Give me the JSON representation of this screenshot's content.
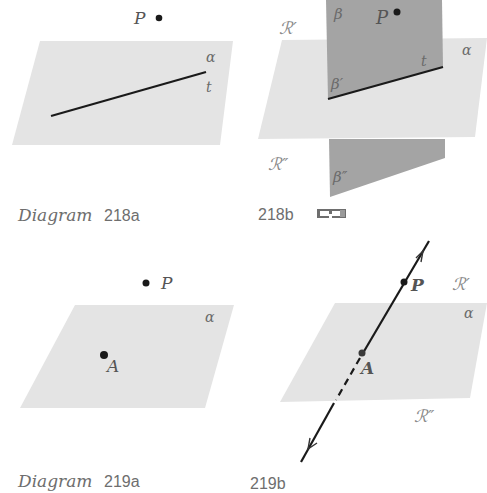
{
  "colors": {
    "plane_light": "#e4e4e4",
    "plane_dark": "#a4a4a4",
    "line": "#1a1a1a",
    "label": "#6a6a6a"
  },
  "diagram_218a": {
    "caption_word": "Diagram",
    "caption_number": "218a",
    "point_label": "P",
    "plane_label": "α",
    "line_label": "t"
  },
  "diagram_218b": {
    "caption_number": "218b",
    "icon": "3d-glasses-icon",
    "region_upper": "ℛ′",
    "region_lower": "ℛ″",
    "plane_label": "α",
    "half_plane_label": "β",
    "half_plane_upper_label": "β′",
    "half_plane_lower_label": "β″",
    "point_label": "P",
    "line_label": "t"
  },
  "diagram_219a": {
    "caption_word": "Diagram",
    "caption_number": "219a",
    "point_p_label": "P",
    "point_a_label": "A",
    "plane_label": "α"
  },
  "diagram_219b": {
    "caption_number": "219b",
    "point_p_label": "P",
    "point_a_label": "A",
    "plane_label": "α",
    "region_upper": "ℛ′",
    "region_lower": "ℛ″"
  }
}
